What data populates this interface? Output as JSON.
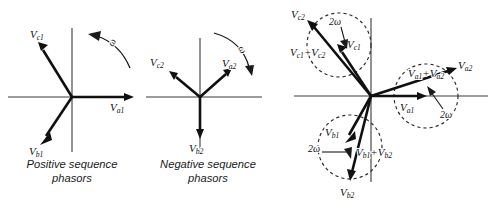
{
  "figure": {
    "width": 495,
    "height": 210,
    "background": "#ffffff",
    "stroke_color": "#101010",
    "axis_color": "#3a3a3a",
    "dashed_color": "#2a2a2a"
  },
  "panels": [
    {
      "id": "positive-sequence",
      "caption": "Positive sequence\nphasors",
      "center": {
        "x": 72,
        "y": 97
      },
      "rotation": {
        "symbol": "ω",
        "direction": "counterclockwise"
      },
      "phasors": [
        {
          "name": "Va1",
          "base": "V",
          "sub": "a1",
          "angle_deg": 0,
          "length": 62
        },
        {
          "name": "Vb1",
          "base": "V",
          "sub": "b1",
          "angle_deg": 240,
          "length": 62
        },
        {
          "name": "Vc1",
          "base": "V",
          "sub": "c1",
          "angle_deg": 120,
          "length": 62
        }
      ]
    },
    {
      "id": "negative-sequence",
      "caption": "Negative sequence\nphasors",
      "center": {
        "x": 200,
        "y": 97
      },
      "rotation": {
        "symbol": "ω",
        "direction": "clockwise"
      },
      "phasors": [
        {
          "name": "Va2",
          "base": "V",
          "sub": "a2",
          "angle_deg": 45,
          "length": 38
        },
        {
          "name": "Vb2",
          "base": "V",
          "sub": "b2",
          "angle_deg": 270,
          "length": 44
        },
        {
          "name": "Vc2",
          "base": "V",
          "sub": "c2",
          "angle_deg": 152,
          "length": 38
        }
      ]
    },
    {
      "id": "combined-sequence",
      "caption": "",
      "center": {
        "x": 371,
        "y": 96
      },
      "rotation": {
        "symbol": "2ω",
        "direction": "mixed"
      },
      "phasors": [
        {
          "name": "Va1",
          "base": "V",
          "sub": "a1",
          "angle_deg": 0,
          "length": 55
        },
        {
          "name": "Vb1",
          "base": "V",
          "sub": "b1",
          "angle_deg": 248,
          "length": 55
        },
        {
          "name": "Vc1",
          "base": "V",
          "sub": "c1",
          "angle_deg": 112,
          "length": 55
        },
        {
          "name": "Va2",
          "base": "V",
          "sub": "a2",
          "angle_deg": 18,
          "length": 82
        },
        {
          "name": "Vb2",
          "base": "V",
          "sub": "b2",
          "angle_deg": 266,
          "length": 96
        },
        {
          "name": "Vc2",
          "base": "V",
          "sub": "c2",
          "angle_deg": 140,
          "length": 97
        }
      ],
      "resultants": [
        {
          "name": "Va1+Va2",
          "base": "V",
          "sub1": "a1",
          "plus": "+",
          "base2": "V",
          "sub2": "a2"
        },
        {
          "name": "Vb1+Vb2",
          "base": "V",
          "sub1": "b1",
          "plus": "+",
          "base2": "V",
          "sub2": "b2"
        },
        {
          "name": "Vc1+Vc2",
          "base": "V",
          "sub1": "c1",
          "plus": "+",
          "base2": "V",
          "sub2": "c2"
        }
      ],
      "loci": [
        {
          "name": "locus-a",
          "cx": 426,
          "cy": 96,
          "r": 32,
          "rate": "2ω"
        },
        {
          "name": "locus-b",
          "cx": 350,
          "cy": 147,
          "r": 32,
          "rate": "2ω"
        },
        {
          "name": "locus-c",
          "cx": 339,
          "cy": 45,
          "r": 32,
          "rate": "2ω"
        }
      ]
    }
  ],
  "labels": {
    "V": "V",
    "plus": "+",
    "omega": "ω",
    "two_omega": "2ω",
    "a1": "a1",
    "b1": "b1",
    "c1": "c1",
    "a2": "a2",
    "b2": "b2",
    "c2": "c2",
    "caption_positive": "Positive sequence\nphasors",
    "caption_negative": "Negative sequence\nphasors"
  }
}
